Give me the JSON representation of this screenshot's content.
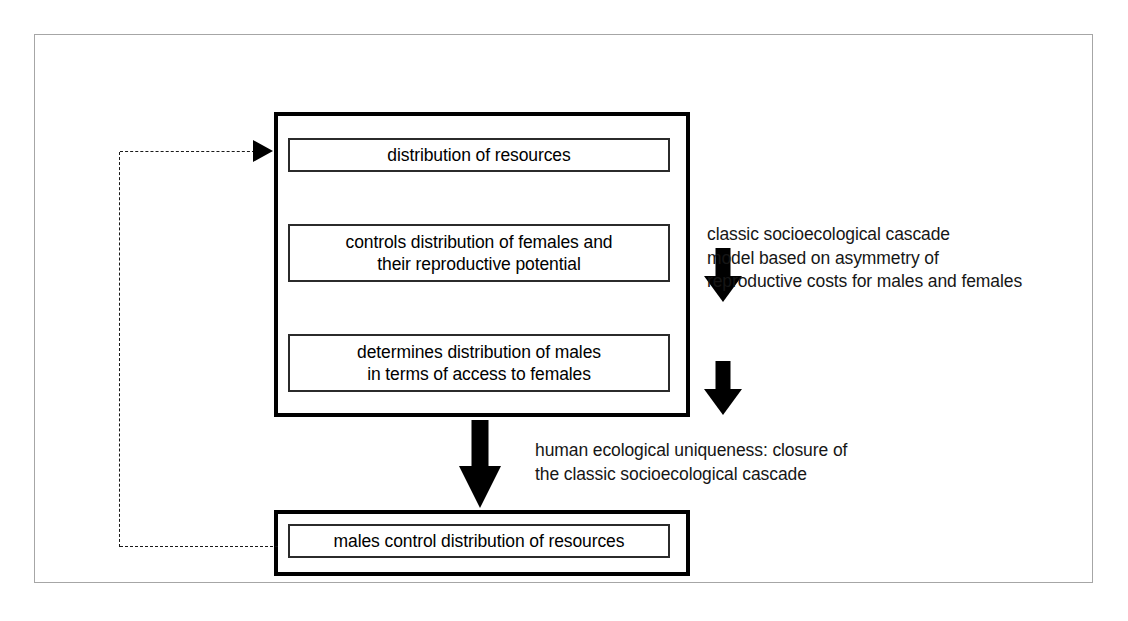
{
  "figure": {
    "frame_color": "#a6a6a6",
    "background_color": "#ffffff",
    "line_color": "#000000"
  },
  "cascade": {
    "nodes": [
      {
        "id": "resources",
        "label": "distribution of resources"
      },
      {
        "id": "females",
        "label": "controls distribution of females and\ntheir reproductive potential"
      },
      {
        "id": "males",
        "label": "determines distribution of males\nin terms of access to females"
      }
    ]
  },
  "outcome": {
    "node": {
      "id": "males-control-resources",
      "label": "males control distribution of resources"
    }
  },
  "annotations": [
    {
      "id": "classic-cascade-note",
      "text": "classic socioecological cascade\nmodel based on asymmetry of\nreproductive costs for males and females"
    },
    {
      "id": "human-uniqueness-note",
      "text": "human ecological uniqueness: closure of\nthe classic socioecological cascade"
    }
  ],
  "connectors": {
    "arrow_resources_to_females": "down-arrow-icon",
    "arrow_females_to_males": "down-arrow-icon",
    "arrow_cascade_to_outcome": "down-arrow-icon",
    "feedback_loop": "dashed-feedback-arrow-icon"
  }
}
